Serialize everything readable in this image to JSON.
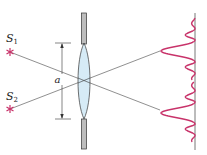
{
  "diagram": {
    "sources": [
      {
        "label": "S",
        "subscript": "1"
      },
      {
        "label": "S",
        "subscript": "2"
      }
    ],
    "aperture_label": "a",
    "colors": {
      "source": "#c8336a",
      "intensity_curve": "#c8336a",
      "lens_fill": "#cfe8f4",
      "lens_stroke": "#333333",
      "ray": "#444444",
      "plate_fill": "#bdbdbd",
      "plate_stroke": "#333333",
      "screen": "#555555"
    }
  }
}
